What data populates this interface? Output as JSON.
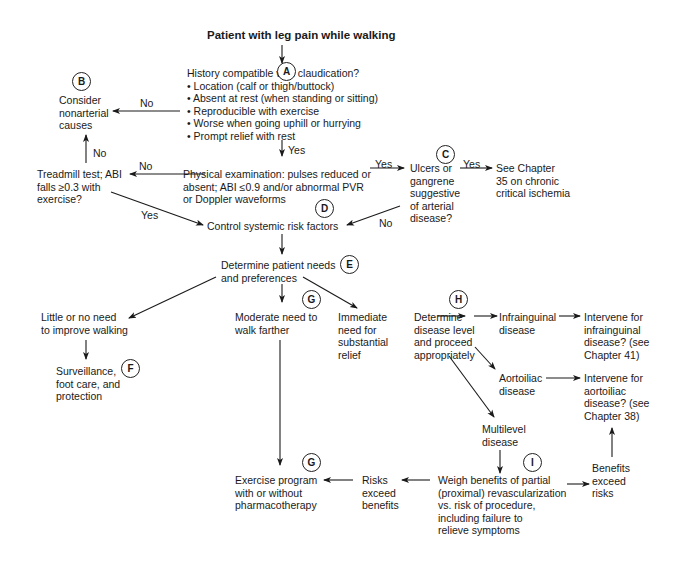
{
  "title": "Patient with leg pain while walking",
  "nodes": {
    "history": {
      "heading": "History compatible with claudication?",
      "bullets": [
        "• Location (calf or thigh/buttock)",
        "• Absent at rest (when standing or sitting)",
        "• Reproducible with exercise",
        "• Worse when going uphill or hurrying",
        "• Prompt relief with rest"
      ]
    },
    "nonarterial": [
      "Consider",
      "nonarterial",
      "causes"
    ],
    "physical": [
      "Physical examination: pulses reduced or",
      "absent; ABI ≤0.9 and/or abnormal PVR",
      "or Doppler waveforms"
    ],
    "treadmill": [
      "Treadmill test; ABI",
      "falls ≥0.3 with",
      "exercise?"
    ],
    "ulcers": [
      "Ulcers or",
      "gangrene",
      "suggestive",
      "of arterial",
      "disease?"
    ],
    "chapter35": [
      "See Chapter",
      "35 on chronic",
      "critical ischemia"
    ],
    "control": "Control systemic risk factors",
    "needs": [
      "Determine patient needs",
      "and preferences"
    ],
    "little": [
      "Little or no need",
      "to improve walking"
    ],
    "surveillance": [
      "Surveillance,",
      "foot care, and",
      "protection"
    ],
    "moderate": [
      "Moderate need to",
      "walk farther"
    ],
    "immediate": [
      "Immediate",
      "need for",
      "substantial",
      "relief"
    ],
    "level": [
      "Determine",
      "disease level",
      "and proceed",
      "appropriately"
    ],
    "infrainguinal": [
      "Infrainguinal",
      "disease"
    ],
    "aortoiliac": [
      "Aortoiliac",
      "disease"
    ],
    "multilevel": [
      "Multilevel",
      "disease"
    ],
    "intervene_infra": [
      "Intervene for",
      "infrainguinal",
      "disease? (see",
      "Chapter 41)"
    ],
    "intervene_aorto": [
      "Intervene for",
      "aortoiliac",
      "disease? (see",
      "Chapter 38)"
    ],
    "weigh": [
      "Weigh benefits of partial",
      "(proximal) revascularization",
      "vs. risk of procedure,",
      "including failure to",
      "relieve symptoms"
    ],
    "risks": [
      "Risks",
      "exceed",
      "benefits"
    ],
    "benefits": [
      "Benefits",
      "exceed",
      "risks"
    ],
    "exercise": [
      "Exercise program",
      "with or without",
      "pharmacotherapy"
    ]
  },
  "badges": {
    "A": "A",
    "B": "B",
    "C": "C",
    "D": "D",
    "E": "E",
    "F": "F",
    "G1": "G",
    "G2": "G",
    "H": "H",
    "I": "I"
  },
  "edge_labels": {
    "hist_no": "No",
    "hist_yes": "Yes",
    "tread_no": "No",
    "phys_no": "No",
    "phys_yes": "Yes",
    "tread_yes": "Yes",
    "ulcer_yes": "Yes",
    "ulcer_no": "No"
  }
}
